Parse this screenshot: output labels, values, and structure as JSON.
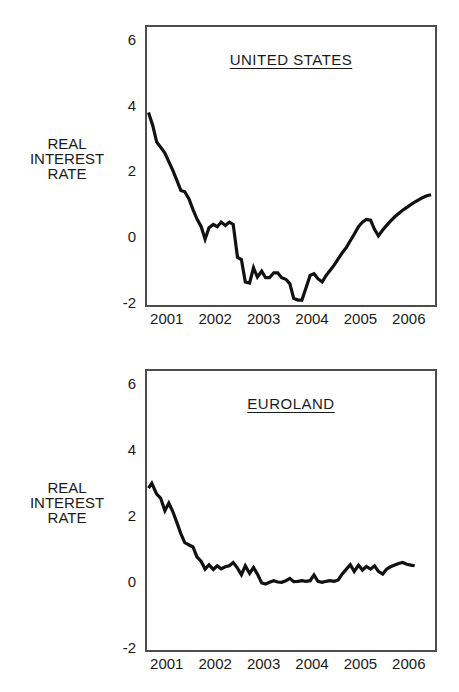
{
  "figure": {
    "background_color": "#ffffff",
    "line_color": "#111111",
    "frame_color": "#4d4d4d",
    "text_color": "#1a1a1a"
  },
  "chart_data": [
    {
      "type": "line",
      "title": "UNITED STATES",
      "ylabel": "REAL\nINTEREST\nRATE",
      "xlabel": "",
      "x_range": [
        2000.55,
        2006.5
      ],
      "y_range": [
        -2,
        6.45
      ],
      "x_ticks": [
        2001,
        2002,
        2003,
        2004,
        2005,
        2006
      ],
      "y_ticks": [
        6,
        4,
        2,
        0,
        -2
      ],
      "grid": false,
      "legend": "none",
      "series": [
        {
          "name": "UNITED STATES real interest rate",
          "points": [
            [
              2000.58,
              3.85
            ],
            [
              2000.67,
              3.45
            ],
            [
              2000.75,
              2.95
            ],
            [
              2000.83,
              2.8
            ],
            [
              2000.92,
              2.62
            ],
            [
              2001.0,
              2.36
            ],
            [
              2001.08,
              2.1
            ],
            [
              2001.17,
              1.78
            ],
            [
              2001.25,
              1.48
            ],
            [
              2001.33,
              1.44
            ],
            [
              2001.42,
              1.22
            ],
            [
              2001.5,
              0.9
            ],
            [
              2001.58,
              0.62
            ],
            [
              2001.67,
              0.38
            ],
            [
              2001.75,
              0.0
            ],
            [
              2001.83,
              0.35
            ],
            [
              2001.92,
              0.45
            ],
            [
              2002.0,
              0.38
            ],
            [
              2002.08,
              0.52
            ],
            [
              2002.17,
              0.42
            ],
            [
              2002.25,
              0.52
            ],
            [
              2002.33,
              0.45
            ],
            [
              2002.42,
              -0.55
            ],
            [
              2002.5,
              -0.62
            ],
            [
              2002.58,
              -1.3
            ],
            [
              2002.67,
              -1.33
            ],
            [
              2002.75,
              -0.87
            ],
            [
              2002.83,
              -1.15
            ],
            [
              2002.92,
              -0.97
            ],
            [
              2003.0,
              -1.17
            ],
            [
              2003.08,
              -1.17
            ],
            [
              2003.17,
              -1.02
            ],
            [
              2003.25,
              -1.02
            ],
            [
              2003.33,
              -1.17
            ],
            [
              2003.42,
              -1.22
            ],
            [
              2003.5,
              -1.35
            ],
            [
              2003.58,
              -1.8
            ],
            [
              2003.67,
              -1.85
            ],
            [
              2003.75,
              -1.85
            ],
            [
              2003.83,
              -1.5
            ],
            [
              2003.92,
              -1.1
            ],
            [
              2004.0,
              -1.05
            ],
            [
              2004.08,
              -1.2
            ],
            [
              2004.17,
              -1.3
            ],
            [
              2004.25,
              -1.1
            ],
            [
              2004.33,
              -0.95
            ],
            [
              2004.42,
              -0.78
            ],
            [
              2004.5,
              -0.6
            ],
            [
              2004.58,
              -0.42
            ],
            [
              2004.67,
              -0.25
            ],
            [
              2004.75,
              -0.05
            ],
            [
              2004.83,
              0.15
            ],
            [
              2004.92,
              0.38
            ],
            [
              2005.0,
              0.52
            ],
            [
              2005.08,
              0.6
            ],
            [
              2005.17,
              0.58
            ],
            [
              2005.25,
              0.3
            ],
            [
              2005.33,
              0.1
            ],
            [
              2005.42,
              0.28
            ],
            [
              2005.5,
              0.42
            ],
            [
              2005.58,
              0.55
            ],
            [
              2005.67,
              0.68
            ],
            [
              2005.75,
              0.78
            ],
            [
              2005.83,
              0.88
            ],
            [
              2005.92,
              0.97
            ],
            [
              2006.0,
              1.05
            ],
            [
              2006.08,
              1.13
            ],
            [
              2006.17,
              1.2
            ],
            [
              2006.25,
              1.27
            ],
            [
              2006.33,
              1.32
            ],
            [
              2006.42,
              1.35
            ]
          ]
        }
      ]
    },
    {
      "type": "line",
      "title": "EUROLAND",
      "ylabel": "REAL\nINTEREST\nRATE",
      "xlabel": "",
      "x_range": [
        2000.55,
        2006.5
      ],
      "y_range": [
        -2,
        6.45
      ],
      "x_ticks": [
        2001,
        2002,
        2003,
        2004,
        2005,
        2006
      ],
      "y_ticks": [
        6,
        4,
        2,
        0,
        -2
      ],
      "grid": false,
      "legend": "none",
      "series": [
        {
          "name": "EUROLAND real interest rate",
          "points": [
            [
              2000.58,
              2.9
            ],
            [
              2000.65,
              3.05
            ],
            [
              2000.75,
              2.72
            ],
            [
              2000.83,
              2.6
            ],
            [
              2000.92,
              2.22
            ],
            [
              2001.0,
              2.45
            ],
            [
              2001.08,
              2.2
            ],
            [
              2001.17,
              1.85
            ],
            [
              2001.25,
              1.52
            ],
            [
              2001.33,
              1.25
            ],
            [
              2001.42,
              1.18
            ],
            [
              2001.5,
              1.12
            ],
            [
              2001.58,
              0.82
            ],
            [
              2001.67,
              0.68
            ],
            [
              2001.75,
              0.45
            ],
            [
              2001.83,
              0.58
            ],
            [
              2001.92,
              0.44
            ],
            [
              2002.0,
              0.55
            ],
            [
              2002.08,
              0.46
            ],
            [
              2002.17,
              0.52
            ],
            [
              2002.25,
              0.55
            ],
            [
              2002.33,
              0.65
            ],
            [
              2002.42,
              0.48
            ],
            [
              2002.5,
              0.28
            ],
            [
              2002.58,
              0.55
            ],
            [
              2002.67,
              0.32
            ],
            [
              2002.75,
              0.5
            ],
            [
              2002.83,
              0.3
            ],
            [
              2002.92,
              0.03
            ],
            [
              2003.0,
              0.0
            ],
            [
              2003.08,
              0.05
            ],
            [
              2003.17,
              0.1
            ],
            [
              2003.25,
              0.06
            ],
            [
              2003.33,
              0.05
            ],
            [
              2003.42,
              0.1
            ],
            [
              2003.5,
              0.17
            ],
            [
              2003.58,
              0.07
            ],
            [
              2003.67,
              0.08
            ],
            [
              2003.75,
              0.1
            ],
            [
              2003.83,
              0.08
            ],
            [
              2003.92,
              0.1
            ],
            [
              2004.0,
              0.27
            ],
            [
              2004.08,
              0.08
            ],
            [
              2004.17,
              0.05
            ],
            [
              2004.25,
              0.08
            ],
            [
              2004.33,
              0.1
            ],
            [
              2004.42,
              0.08
            ],
            [
              2004.5,
              0.12
            ],
            [
              2004.58,
              0.3
            ],
            [
              2004.67,
              0.45
            ],
            [
              2004.75,
              0.58
            ],
            [
              2004.83,
              0.38
            ],
            [
              2004.92,
              0.57
            ],
            [
              2005.0,
              0.42
            ],
            [
              2005.08,
              0.53
            ],
            [
              2005.17,
              0.45
            ],
            [
              2005.25,
              0.55
            ],
            [
              2005.33,
              0.38
            ],
            [
              2005.42,
              0.3
            ],
            [
              2005.5,
              0.45
            ],
            [
              2005.58,
              0.52
            ],
            [
              2005.67,
              0.57
            ],
            [
              2005.75,
              0.62
            ],
            [
              2005.83,
              0.65
            ],
            [
              2005.92,
              0.6
            ],
            [
              2006.0,
              0.57
            ],
            [
              2006.08,
              0.55
            ]
          ]
        }
      ]
    }
  ]
}
